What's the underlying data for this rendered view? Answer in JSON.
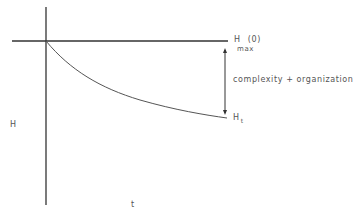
{
  "diagram": {
    "axis_labels": {
      "y": "H",
      "x": "t"
    },
    "top_line_label": {
      "main": "H",
      "paren": "(0)",
      "sub": "max"
    },
    "curve_end_label": {
      "main": "H",
      "sub": "t"
    },
    "arrow_label": "complexity + organization",
    "colors": {
      "line": "#222222",
      "curve": "#555555",
      "text": "#555555"
    }
  }
}
